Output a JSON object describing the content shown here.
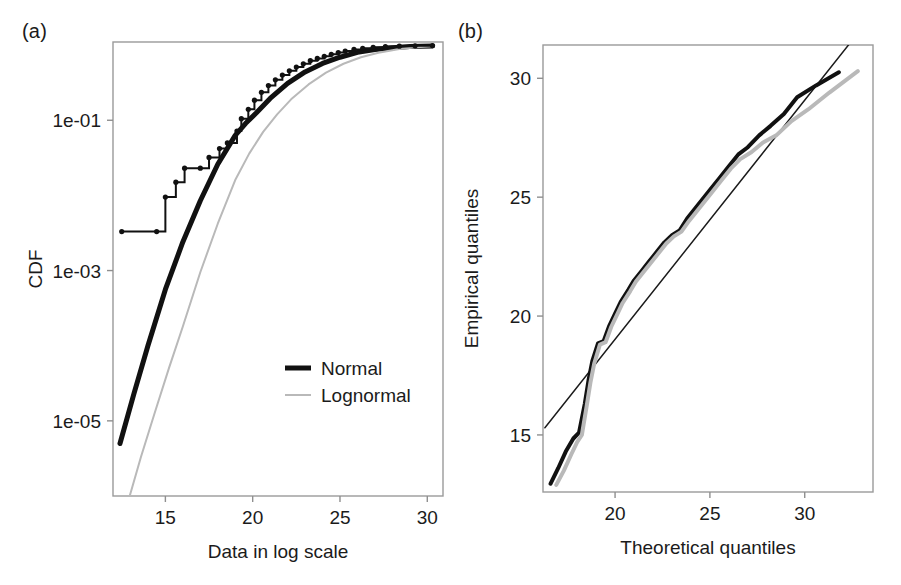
{
  "figure": {
    "panels": [
      {
        "label": "(a)",
        "name": "cdf-panel",
        "axis": {
          "xlabel": "Data in log scale",
          "ylabel": "CDF",
          "xticks": [
            "15",
            "20",
            "25",
            "30"
          ],
          "yticks": [
            "1e-01",
            "1e-03",
            "1e-05"
          ]
        },
        "legend": [
          {
            "label": "Normal",
            "color": "#111111",
            "width": 5
          },
          {
            "label": "Lognormal",
            "color": "#b9b9b9",
            "width": 2
          }
        ]
      },
      {
        "label": "(b)",
        "name": "qq-panel",
        "axis": {
          "xlabel": "Theoretical quantiles",
          "ylabel": "Empirical quantiles",
          "xticks": [
            "20",
            "25",
            "30"
          ],
          "yticks": [
            "15",
            "20",
            "25",
            "30"
          ]
        }
      }
    ]
  },
  "chart_data": [
    {
      "type": "line",
      "name": "cdf-plot",
      "title": "",
      "xlabel": "Data in log scale",
      "ylabel": "CDF",
      "xlim": [
        12.0,
        30.9
      ],
      "ylim": [
        1e-06,
        1.1
      ],
      "yscale": "log",
      "xticks": [
        15,
        20,
        25,
        30
      ],
      "yticks": [
        0.1,
        0.001,
        1e-05
      ],
      "ytick_labels": [
        "1e-01",
        "1e-03",
        "1e-05"
      ],
      "grid": false,
      "legend_position": "lower-right",
      "series": [
        {
          "name": "Normal",
          "color": "#111111",
          "width": 5,
          "x": [
            12.4,
            13.2,
            14.0,
            15.0,
            16.0,
            17.0,
            18.0,
            19.0,
            19.6,
            20.2,
            21.0,
            22.0,
            23.0,
            24.0,
            25.0,
            26.0,
            27.0,
            28.0,
            29.0,
            30.3
          ],
          "y": [
            5e-06,
            2.3e-05,
            0.0001,
            0.00056,
            0.0024,
            0.0085,
            0.026,
            0.063,
            0.091,
            0.125,
            0.195,
            0.31,
            0.44,
            0.57,
            0.69,
            0.8,
            0.875,
            0.925,
            0.955,
            0.975
          ]
        },
        {
          "name": "Lognormal",
          "color": "#b9b9b9",
          "width": 2,
          "x": [
            12.9,
            13.6,
            14.4,
            15.2,
            16.0,
            17.0,
            18.0,
            19.0,
            19.8,
            20.6,
            21.4,
            22.2,
            23.2,
            24.2,
            25.2,
            26.2,
            27.2,
            28.4,
            29.4,
            30.3
          ],
          "y": [
            9e-07,
            3.3e-06,
            1.3e-05,
            5e-05,
            0.00018,
            0.00095,
            0.0042,
            0.016,
            0.036,
            0.07,
            0.12,
            0.19,
            0.3,
            0.43,
            0.565,
            0.69,
            0.79,
            0.885,
            0.935,
            0.965
          ]
        },
        {
          "name": "Empirical CDF",
          "color": "#111111",
          "width": 2,
          "kind": "step-ecdf",
          "x": [
            12.5,
            14.5,
            15.0,
            15.6,
            16.1,
            17.0,
            17.5,
            18.1,
            18.55,
            19.1,
            19.35,
            19.75,
            20.1,
            20.5,
            20.9,
            21.3,
            21.7,
            22.1,
            22.5,
            22.9,
            23.3,
            23.7,
            24.1,
            24.5,
            24.9,
            25.3,
            25.8,
            26.3,
            26.9,
            27.6,
            28.4,
            29.3,
            30.3
          ],
          "y": [
            0.0033,
            0.0033,
            0.0095,
            0.015,
            0.023,
            0.023,
            0.032,
            0.042,
            0.05,
            0.072,
            0.105,
            0.14,
            0.185,
            0.235,
            0.29,
            0.345,
            0.4,
            0.455,
            0.51,
            0.565,
            0.62,
            0.665,
            0.71,
            0.755,
            0.795,
            0.835,
            0.875,
            0.905,
            0.935,
            0.955,
            0.968,
            0.978,
            0.985
          ]
        }
      ]
    },
    {
      "type": "line",
      "name": "qq-plot",
      "title": "",
      "xlabel": "Theoretical quantiles",
      "ylabel": "Empirical quantiles",
      "xlim": [
        16.2,
        33.6
      ],
      "ylim": [
        12.6,
        31.4
      ],
      "xticks": [
        20,
        25,
        30
      ],
      "yticks": [
        15,
        20,
        25,
        30
      ],
      "grid": false,
      "legend_position": "none",
      "series": [
        {
          "name": "Reference line",
          "color": "#1b1b1b",
          "width": 1.5,
          "x": [
            16.3,
            33.6
          ],
          "y": [
            15.3,
            32.7
          ]
        },
        {
          "name": "Normal",
          "color": "#111111",
          "width": 4,
          "x": [
            16.6,
            17.0,
            17.4,
            17.8,
            18.1,
            18.4,
            18.6,
            18.8,
            19.1,
            19.4,
            19.7,
            20.0,
            20.3,
            20.7,
            21.0,
            21.4,
            21.8,
            22.2,
            22.6,
            23.0,
            23.4,
            23.8,
            24.2,
            24.6,
            25.0,
            25.5,
            26.0,
            26.5,
            27.0,
            27.6,
            28.2,
            28.9,
            29.6,
            30.6,
            31.8
          ],
          "y": [
            12.95,
            13.6,
            14.3,
            14.85,
            15.1,
            16.3,
            17.3,
            18.1,
            18.85,
            18.95,
            19.6,
            20.1,
            20.6,
            21.1,
            21.5,
            21.9,
            22.3,
            22.7,
            23.1,
            23.4,
            23.6,
            24.1,
            24.5,
            24.9,
            25.3,
            25.8,
            26.3,
            26.8,
            27.1,
            27.6,
            28.0,
            28.5,
            29.2,
            29.7,
            30.25
          ]
        },
        {
          "name": "Lognormal",
          "color": "#b9b9b9",
          "width": 4,
          "x": [
            16.9,
            17.3,
            17.7,
            18.0,
            18.25,
            18.5,
            18.7,
            18.9,
            19.2,
            19.5,
            19.8,
            20.1,
            20.4,
            20.8,
            21.1,
            21.5,
            21.9,
            22.3,
            22.7,
            23.1,
            23.5,
            23.9,
            24.3,
            24.7,
            25.1,
            25.6,
            26.1,
            26.6,
            27.2,
            27.8,
            28.5,
            29.3,
            30.2,
            31.3,
            32.8
          ],
          "y": [
            12.9,
            13.5,
            14.2,
            14.7,
            15.0,
            16.2,
            17.2,
            18.0,
            18.8,
            18.9,
            19.55,
            20.05,
            20.55,
            21.05,
            21.45,
            21.85,
            22.25,
            22.65,
            23.05,
            23.35,
            23.55,
            24.0,
            24.4,
            24.8,
            25.2,
            25.7,
            26.2,
            26.6,
            26.9,
            27.3,
            27.6,
            28.2,
            28.7,
            29.4,
            30.3
          ]
        }
      ]
    }
  ]
}
